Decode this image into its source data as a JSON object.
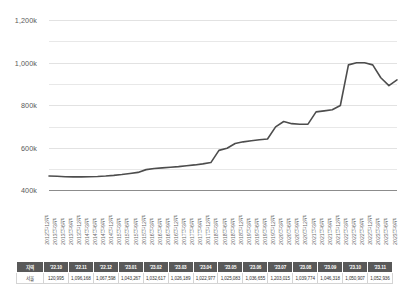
{
  "chart_data": {
    "type": "line",
    "title": "",
    "xlabel": "",
    "ylabel": "",
    "ylim": [
      400000,
      1200000
    ],
    "yticks": [
      400000,
      600000,
      800000,
      1000000,
      1200000
    ],
    "ytick_labels": [
      "400k",
      "600k",
      "800k",
      "1,000k",
      "1,200k"
    ],
    "grid": true,
    "minor_gridlines": [
      500000,
      700000,
      900000,
      1100000
    ],
    "legend": "none",
    "line_color": "#4d4d4d",
    "x": [
      "2012년 12월",
      "2013년 3월",
      "2013년 6월",
      "2013년 9월",
      "2013년 12월",
      "2014년 3월",
      "2014년 6월",
      "2014년 9월",
      "2014년 12월",
      "2015년 3월",
      "2015년 6월",
      "2015년 9월",
      "2015년 12월",
      "2016년 3월",
      "2016년 6월",
      "2016년 9월",
      "2016년 12월",
      "2017년 3월",
      "2017년 6월",
      "2017년 9월",
      "2017년 12월",
      "2018년 3월",
      "2018년 6월",
      "2018년 9월",
      "2018년 12월",
      "2019년 3월",
      "2019년 6월",
      "2019년 9월",
      "2019년 12월",
      "2020년 3월",
      "2020년 6월",
      "2020년 9월",
      "2020년 12월",
      "2021년 3월",
      "2021년 6월",
      "2021년 9월",
      "2021년 12월",
      "2022년 3월",
      "2022년 6월",
      "2022년 9월",
      "2022년 12월",
      "2023년 3월",
      "2023년 6월",
      "2023년 9월"
    ],
    "series": [
      {
        "name": "서울",
        "values": [
          470000,
          469000,
          467000,
          466000,
          466000,
          467000,
          468000,
          470000,
          473000,
          477000,
          482000,
          487000,
          500000,
          505000,
          508000,
          511000,
          514000,
          518000,
          522000,
          527000,
          533000,
          590000,
          600000,
          622000,
          630000,
          635000,
          640000,
          643000,
          700000,
          725000,
          715000,
          712000,
          713000,
          770000,
          775000,
          780000,
          800000,
          990000,
          1000000,
          1000000,
          990000,
          930000,
          893000,
          920000
        ]
      }
    ]
  },
  "table": {
    "headers": [
      "지역",
      "'22.10",
      "'22.11",
      "'22.12",
      "'23.01",
      "'23.02",
      "'23.03",
      "'23.04",
      "'23.05",
      "'23.06",
      "'23.07",
      "'23.08",
      "'23.09",
      "'23.10",
      "'23.11"
    ],
    "rows": [
      {
        "region": "서울",
        "values": [
          "120,995",
          "1,096,168",
          "1,067,598",
          "1,043,267",
          "1,032,617",
          "1,026,189",
          "1,022,977",
          "1,025,083",
          "1,036,655",
          "1,203,015",
          "1,039,774",
          "1,046,318",
          "1,050,907",
          "1,052,936"
        ]
      }
    ]
  }
}
